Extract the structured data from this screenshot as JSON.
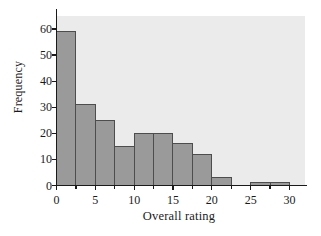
{
  "chart_data": {
    "type": "bar",
    "subtype": "histogram",
    "title": "",
    "xlabel": "Overall rating",
    "ylabel": "Frequency",
    "bin_width": 2.5,
    "bin_edges": [
      0,
      2.5,
      5,
      7.5,
      10,
      12.5,
      15,
      17.5,
      20,
      22.5,
      25,
      27.5,
      30
    ],
    "categories": [
      "0-2.5",
      "2.5-5",
      "5-7.5",
      "7.5-10",
      "10-12.5",
      "12.5-15",
      "15-17.5",
      "17.5-20",
      "20-22.5",
      "22.5-25",
      "25-27.5",
      "27.5-30"
    ],
    "values": [
      59,
      31,
      25,
      15,
      20,
      20,
      16,
      12,
      3,
      0,
      1,
      1
    ],
    "xlim": [
      0,
      32
    ],
    "ylim": [
      0,
      65
    ],
    "xticks": [
      0,
      5,
      10,
      15,
      20,
      25,
      30
    ],
    "xtick_labels": [
      "0",
      "5",
      "10",
      "15",
      "20",
      "25",
      "30"
    ],
    "xminor_ticks": [
      2.5,
      7.5,
      12.5,
      17.5,
      22.5,
      27.5
    ],
    "yticks": [
      0,
      10,
      20,
      30,
      40,
      50,
      60
    ],
    "ytick_labels": [
      "0",
      "10",
      "20",
      "30",
      "40",
      "50",
      "60"
    ],
    "grid": false,
    "legend": "none",
    "bar_color": "#9a9a9a",
    "bar_edge_color": "#4d4d4d",
    "plot_background": "#ebebeb",
    "axis_color": "#1a1a1a"
  }
}
